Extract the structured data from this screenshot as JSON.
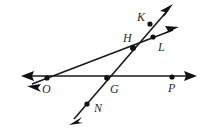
{
  "diagram": {
    "type": "line-intersection-diagram",
    "canvas": {
      "width": 207,
      "height": 129
    },
    "colors": {
      "background": "#ffffff",
      "stroke": "#1a1a1a",
      "point_fill": "#111111",
      "label_fill": "#2b2b2b"
    },
    "points": [
      {
        "id": "O",
        "label": "O",
        "x": 47,
        "y": 78,
        "label_x": 42,
        "label_y": 93,
        "on_lines": [
          "horizontal-line",
          "line-o-l"
        ]
      },
      {
        "id": "G",
        "label": "G",
        "x": 107,
        "y": 78,
        "label_x": 110,
        "label_y": 93,
        "on_lines": [
          "horizontal-line",
          "line-n-k"
        ]
      },
      {
        "id": "H",
        "label": "H",
        "x": 133,
        "y": 48,
        "label_x": 123,
        "label_y": 42,
        "on_lines": [
          "line-o-l",
          "line-n-k"
        ]
      },
      {
        "id": "K",
        "label": "K",
        "x": 150,
        "y": 24,
        "label_x": 137,
        "label_y": 21,
        "on_lines": [
          "line-n-k"
        ]
      },
      {
        "id": "L",
        "label": "L",
        "x": 153,
        "y": 37,
        "label_x": 158,
        "label_y": 51,
        "on_lines": [
          "line-o-l"
        ]
      },
      {
        "id": "N",
        "label": "N",
        "x": 87,
        "y": 104,
        "label_x": 94,
        "label_y": 112,
        "on_lines": [
          "line-n-k"
        ]
      },
      {
        "id": "P",
        "label": "P",
        "x": 172,
        "y": 77,
        "label_x": 168,
        "label_y": 92,
        "on_lines": [
          "horizontal-line"
        ]
      }
    ],
    "lines": [
      {
        "id": "horizontal-line",
        "name": "line-op",
        "through": [
          "O",
          "G",
          "P"
        ],
        "x1": 26,
        "y1": 76,
        "x2": 192,
        "y2": 76,
        "arrow_start": true,
        "arrow_end": true,
        "arrow_start_tip": {
          "x": 21,
          "y": 76
        },
        "arrow_end_tip": {
          "x": 197,
          "y": 76
        }
      },
      {
        "id": "line-o-l",
        "name": "line-ohl",
        "through": [
          "O",
          "H",
          "L"
        ],
        "x1": 32,
        "y1": 84,
        "x2": 173,
        "y2": 30,
        "arrow_start": true,
        "arrow_end": true,
        "arrow_start_tip": {
          "x": 27,
          "y": 86
        },
        "arrow_end_tip": {
          "x": 179,
          "y": 27
        }
      },
      {
        "id": "line-n-k",
        "name": "line-nghk",
        "through": [
          "N",
          "G",
          "H",
          "K"
        ],
        "x1": 74,
        "y1": 119,
        "x2": 168,
        "y2": 10,
        "arrow_start": true,
        "arrow_end": true,
        "arrow_start_tip": {
          "x": 69,
          "y": 125
        },
        "arrow_end_tip": {
          "x": 173,
          "y": 4
        }
      }
    ],
    "labels": [
      "O",
      "G",
      "H",
      "K",
      "L",
      "N",
      "P"
    ]
  }
}
